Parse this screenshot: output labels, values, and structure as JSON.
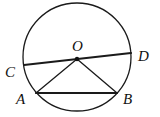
{
  "diagram": {
    "type": "geometry",
    "colors": {
      "stroke": "#1a1a1a",
      "background": "#ffffff"
    },
    "circle": {
      "cx": 77,
      "cy": 57,
      "r": 54
    },
    "points": {
      "O": {
        "x": 77,
        "y": 59,
        "label": "O",
        "lx": 72,
        "ly": 51
      },
      "C": {
        "x": 24,
        "y": 65,
        "label": "C",
        "lx": 5,
        "ly": 77
      },
      "D": {
        "x": 131,
        "y": 53,
        "label": "D",
        "lx": 138,
        "ly": 61
      },
      "A": {
        "x": 36,
        "y": 93,
        "label": "A",
        "lx": 16,
        "ly": 104
      },
      "B": {
        "x": 117,
        "y": 93,
        "label": "B",
        "lx": 123,
        "ly": 104
      }
    },
    "segments": [
      {
        "from": "C",
        "to": "D",
        "weight": 2.2
      },
      {
        "from": "A",
        "to": "B",
        "weight": 2.2
      },
      {
        "from": "O",
        "to": "A",
        "weight": 1.3
      },
      {
        "from": "O",
        "to": "B",
        "weight": 1.3
      }
    ]
  }
}
